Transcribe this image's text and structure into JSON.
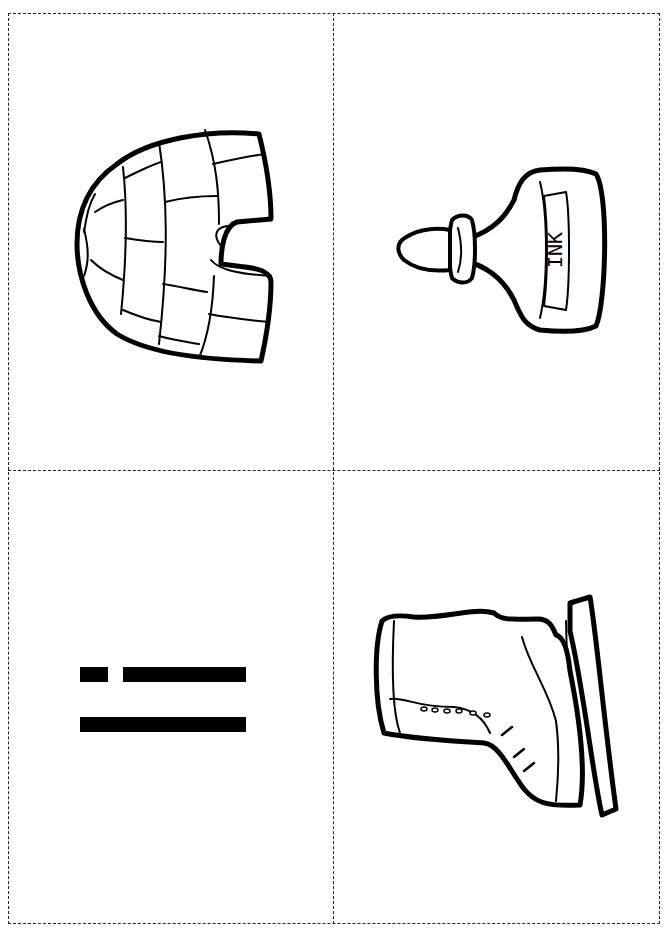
{
  "sheet": {
    "type": "printable picture/letter flashcards",
    "layout": "2x2 grid with dashed cut lines",
    "line_color": "#222222"
  },
  "cards": [
    {
      "position": "top-left",
      "picture": "igloo",
      "label": ""
    },
    {
      "position": "top-right",
      "picture": "ink-bottle",
      "label": "INK"
    },
    {
      "position": "bottom-left",
      "picture": "letter-i-rotated",
      "label": ""
    },
    {
      "position": "bottom-right",
      "picture": "ice-skate",
      "label": ""
    }
  ]
}
